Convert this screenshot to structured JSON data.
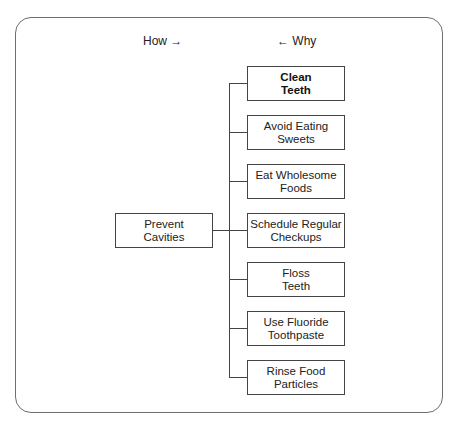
{
  "diagram": {
    "type": "tree-diagram",
    "header": {
      "how_label": "How →",
      "why_label": "← Why"
    },
    "root": {
      "line1": "Prevent",
      "line2": "Cavities"
    },
    "children": [
      {
        "line1": "Clean",
        "line2": "Teeth",
        "bold": true
      },
      {
        "line1": "Avoid Eating",
        "line2": "Sweets",
        "bold": false
      },
      {
        "line1": "Eat Wholesome",
        "line2": "Foods",
        "bold": false
      },
      {
        "line1": "Schedule Regular",
        "line2": "Checkups",
        "bold": false
      },
      {
        "line1": "Floss",
        "line2": "Teeth",
        "bold": false
      },
      {
        "line1": "Use Fluoride",
        "line2": "Toothpaste",
        "bold": false
      },
      {
        "line1": "Rinse Food",
        "line2": "Particles",
        "bold": false
      }
    ]
  }
}
